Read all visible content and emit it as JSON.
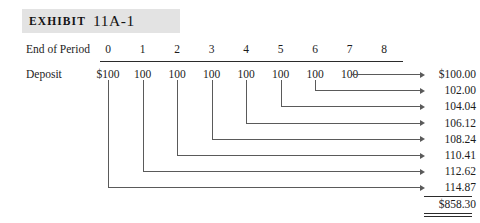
{
  "exhibit": {
    "label": "EXHIBIT",
    "number": "11A-1",
    "band_color": "#e3e3e3"
  },
  "rows": {
    "period_label": "End of Period",
    "deposit_label": "Deposit"
  },
  "periods": [
    "0",
    "1",
    "2",
    "3",
    "4",
    "5",
    "6",
    "7",
    "8"
  ],
  "deposits": [
    "$100",
    "100",
    "100",
    "100",
    "100",
    "100",
    "100",
    "100"
  ],
  "future_values": [
    "$100.00",
    "102.00",
    "104.04",
    "106.12",
    "108.24",
    "110.41",
    "112.62",
    "114.87"
  ],
  "total": {
    "value": "$858.30"
  },
  "style": {
    "line_color": "#5a5a5a",
    "rule_color": "#2b2b2b",
    "text_color": "#1c1c1c",
    "background": "#ffffff"
  },
  "chart_data": {
    "type": "table",
    "title": "EXHIBIT 11A-1",
    "row_labels": [
      "End of Period",
      "Deposit"
    ],
    "categories": [
      "0",
      "1",
      "2",
      "3",
      "4",
      "5",
      "6",
      "7",
      "8"
    ],
    "deposit_values": [
      100,
      100,
      100,
      100,
      100,
      100,
      100,
      100
    ],
    "future_values": [
      100.0,
      102.0,
      104.04,
      106.12,
      108.24,
      110.41,
      112.62,
      114.87
    ],
    "total": 858.3,
    "xlabel": "End of Period",
    "ylabel": "",
    "grid": false,
    "legend": "none"
  }
}
